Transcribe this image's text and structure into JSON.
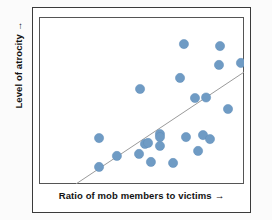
{
  "figure": {
    "background_color": "#fbfbfb",
    "frame_color": "#3b3b3b",
    "plot_border_color": "#555555"
  },
  "labels": {
    "x_axis": "Ratio of mob members to victims",
    "y_axis": "Level of atrocity",
    "arrow_glyph": "→"
  },
  "chart_data": {
    "type": "scatter",
    "title": "",
    "xlabel": "Ratio of mob members to victims",
    "ylabel": "Level of atrocity",
    "xlim": [
      0,
      100
    ],
    "ylim": [
      0,
      100
    ],
    "grid": false,
    "legend": null,
    "axis_ticks": {
      "x": [],
      "y": []
    },
    "marker": {
      "color": "#6f9bc4",
      "edge_color": "#5f8cb8",
      "size": 4.6,
      "shape": "circle"
    },
    "trendline": {
      "present": true,
      "color": "#9a9a9a",
      "width": 1,
      "x_start": 18.0,
      "y_start": 0.0,
      "x_end": 100.0,
      "y_end": 67.0
    },
    "points": [
      {
        "x": 70.7,
        "y": 83.8
      },
      {
        "x": 88.3,
        "y": 82.6
      },
      {
        "x": 87.8,
        "y": 71.3
      },
      {
        "x": 98.5,
        "y": 72.5
      },
      {
        "x": 68.8,
        "y": 63.5
      },
      {
        "x": 49.3,
        "y": 56.9
      },
      {
        "x": 76.1,
        "y": 51.5
      },
      {
        "x": 81.5,
        "y": 51.8
      },
      {
        "x": 92.2,
        "y": 44.9
      },
      {
        "x": 80.0,
        "y": 29.3
      },
      {
        "x": 83.4,
        "y": 26.9
      },
      {
        "x": 29.3,
        "y": 27.5
      },
      {
        "x": 59.0,
        "y": 29.9
      },
      {
        "x": 59.0,
        "y": 28.1
      },
      {
        "x": 51.7,
        "y": 24.0
      },
      {
        "x": 53.2,
        "y": 24.6
      },
      {
        "x": 59.0,
        "y": 22.8
      },
      {
        "x": 38.0,
        "y": 16.8
      },
      {
        "x": 29.3,
        "y": 10.2
      },
      {
        "x": 54.6,
        "y": 13.2
      },
      {
        "x": 65.4,
        "y": 12.6
      },
      {
        "x": 48.8,
        "y": 18.0
      },
      {
        "x": 77.6,
        "y": 19.8
      },
      {
        "x": 71.7,
        "y": 28.1
      }
    ]
  }
}
